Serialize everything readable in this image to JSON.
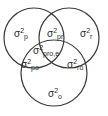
{
  "diagram": {
    "type": "venn-3",
    "symbol": "σ",
    "exponent": "2",
    "circles": [
      {
        "id": "p",
        "label": "p"
      },
      {
        "id": "r",
        "label": "r"
      },
      {
        "id": "o",
        "label": "o"
      }
    ],
    "regions": {
      "p": {
        "base": "σ",
        "exp": "2",
        "sub": "p"
      },
      "r": {
        "base": "σ",
        "exp": "2",
        "sub": "r"
      },
      "o": {
        "base": "σ",
        "exp": "2",
        "sub": "o"
      },
      "pr": {
        "base": "σ",
        "exp": "2",
        "sub": "pr"
      },
      "po": {
        "base": "σ",
        "exp": "2",
        "sub": "po"
      },
      "ro": {
        "base": "σ",
        "exp": "2",
        "sub": "ro"
      },
      "pro": {
        "base": "σ",
        "exp": "2",
        "sub": "pro,e"
      }
    },
    "colors": {
      "stroke": "#3a3a3a",
      "text": "#2a2a2a",
      "background": "#ffffff"
    }
  }
}
